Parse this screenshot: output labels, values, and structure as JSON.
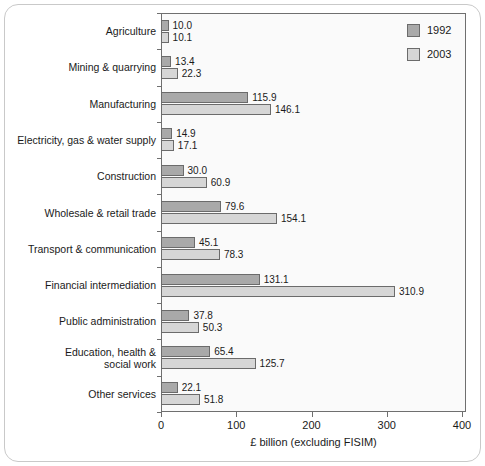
{
  "chart_data": {
    "type": "bar",
    "orientation": "horizontal",
    "title": "",
    "xlabel": "£ billion (excluding FISIM)",
    "ylabel": "",
    "xlim": [
      0,
      400
    ],
    "xticks": [
      0,
      100,
      200,
      300,
      400
    ],
    "xtick_labels": [
      "0",
      "100",
      "200",
      "300",
      "400"
    ],
    "grid": false,
    "legend_position": "top-right",
    "categories": [
      "Agriculture",
      "Mining & quarrying",
      "Manufacturing",
      "Electricity, gas & water supply",
      "Construction",
      "Wholesale & retail trade",
      "Transport & communication",
      "Financial intermediation",
      "Public administration",
      "Education, health & social work",
      "Other services"
    ],
    "series": [
      {
        "name": "1992",
        "color": "#a9a9a9",
        "values": [
          10.0,
          13.4,
          115.9,
          14.9,
          30.0,
          79.6,
          45.1,
          131.1,
          37.8,
          65.4,
          22.1
        ],
        "value_labels": [
          "10.0",
          "13.4",
          "115.9",
          "14.9",
          "30.0",
          "79.6",
          "45.1",
          "131.1",
          "37.8",
          "65.4",
          "22.1"
        ]
      },
      {
        "name": "2003",
        "color": "#d6d6d6",
        "values": [
          10.1,
          22.3,
          146.1,
          17.1,
          60.9,
          154.1,
          78.3,
          310.9,
          50.3,
          125.7,
          51.8
        ],
        "value_labels": [
          "10.1",
          "22.3",
          "146.1",
          "17.1",
          "60.9",
          "154.1",
          "78.3",
          "310.9",
          "50.3",
          "125.7",
          "51.8"
        ]
      }
    ]
  },
  "legend": {
    "entries": [
      {
        "label": "1992",
        "color": "#a9a9a9"
      },
      {
        "label": "2003",
        "color": "#d6d6d6"
      }
    ]
  }
}
